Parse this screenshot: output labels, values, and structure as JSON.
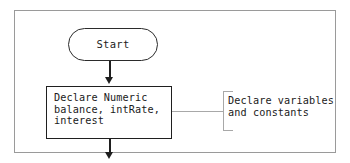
{
  "figure": {
    "type": "flowchart",
    "background_color": "#ffffff",
    "frame_border_color": "#9a9a9a",
    "shape_outline_color": "#1f1f1f",
    "annotation_color": "#a8a8a8",
    "nodes": [
      {
        "id": "start",
        "shape": "terminator",
        "label": "Start"
      },
      {
        "id": "declare",
        "shape": "process",
        "label": "Declare Numeric\nbalance, intRate,\ninterest",
        "lines": [
          "Declare Numeric",
          "balance, intRate,",
          "interest"
        ]
      }
    ],
    "connectors": [
      {
        "id": "start-to-declare",
        "from": "start",
        "to": "declare",
        "arrow": "down"
      },
      {
        "id": "declare-to-next",
        "from": "declare",
        "to": "",
        "arrow": "down"
      }
    ],
    "annotations": [
      {
        "id": "declare-note",
        "target": "declare",
        "style": "bracket",
        "label": "Declare variables\nand constants",
        "lines": [
          "Declare variables",
          "and constants"
        ]
      }
    ]
  }
}
